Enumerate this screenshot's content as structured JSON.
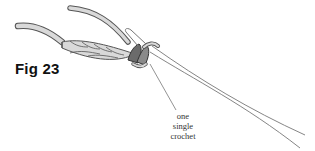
{
  "figure": {
    "label": "Fig 23",
    "annotation": {
      "lines": [
        "one",
        "single",
        "crochet"
      ]
    },
    "elements": [
      "yarn-tail",
      "working-yarn",
      "foundation-chain",
      "single-crochet-stitch",
      "crochet-hook"
    ],
    "colors": {
      "yarn_fill": "#d9d9d9",
      "yarn_outline": "#555555",
      "stitch_highlight": "#6b6b6b",
      "hook_line": "#777777",
      "label_text": "#111111"
    }
  }
}
